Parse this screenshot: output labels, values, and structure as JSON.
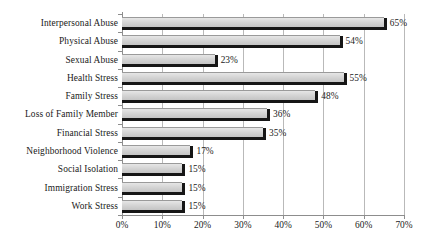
{
  "chart_data": {
    "type": "bar",
    "orientation": "horizontal",
    "title": "",
    "xlabel": "",
    "ylabel": "",
    "xlim": [
      0,
      70
    ],
    "xtick_labels": [
      "0%",
      "10%",
      "20%",
      "30%",
      "40%",
      "50%",
      "60%",
      "70%"
    ],
    "xticks": [
      0,
      10,
      20,
      30,
      40,
      50,
      60,
      70
    ],
    "grid": true,
    "legend": false,
    "categories": [
      "Interpersonal Abuse",
      "Physical Abuse",
      "Sexual Abuse",
      "Health Stress",
      "Family Stress",
      "Loss of Family Member",
      "Financial Stress",
      "Neighborhood Violence",
      "Social Isolation",
      "Immigration Stress",
      "Work Stress"
    ],
    "values": [
      65,
      54,
      23,
      55,
      48,
      36,
      35,
      17,
      15,
      15,
      15
    ],
    "data_labels": [
      "65%",
      "54%",
      "23%",
      "55%",
      "48%",
      "36%",
      "35%",
      "17%",
      "15%",
      "15%",
      "15%"
    ],
    "colors": {
      "bar_fill": "#d2d2d2",
      "bar_shadow": "#161616",
      "gridline": "#b9b9b9",
      "axis": "#8d8d8d",
      "text": "#1a1a1a",
      "background": "#ffffff"
    }
  }
}
